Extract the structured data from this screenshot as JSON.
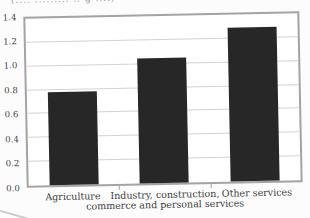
{
  "figure": {
    "top_caption_fragment": "(.... ......... .. g ....)"
  },
  "chart_data": {
    "type": "bar",
    "title": "",
    "xlabel": "",
    "ylabel": "",
    "categories": [
      "Agriculture",
      "Industry, construction, commerce and personal services",
      "Other services"
    ],
    "categories_lines": [
      [
        "Agriculture"
      ],
      [
        "Industry, construction,",
        "commerce and personal services"
      ],
      [
        "Other services"
      ]
    ],
    "values": [
      0.78,
      1.05,
      1.29
    ],
    "ylim": [
      0,
      1.4
    ],
    "yticks": [
      0,
      0.2,
      0.4,
      0.6,
      0.8,
      1.0,
      1.2,
      1.4
    ],
    "ytick_labels": [
      "0.0",
      "0.2",
      "0.4",
      "0.6",
      "0.8",
      "1.0",
      "1.2",
      "1.4"
    ],
    "grid": true,
    "legend": null,
    "bar_color": "#272727",
    "frame_color": "#a3a3a3",
    "gridline_color": "#d2d2d2",
    "text_color": "#3d3d3d"
  }
}
